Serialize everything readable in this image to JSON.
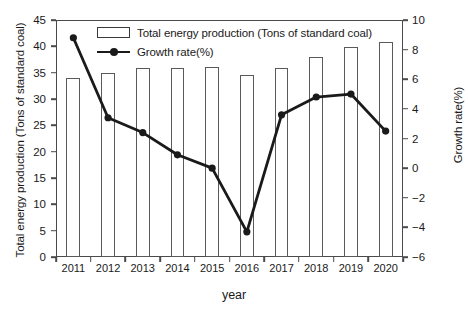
{
  "chart_data": {
    "type": "bar",
    "title": "",
    "subtitle": "",
    "xlabel": "year",
    "ylabel": "Total energy production (Tons of standard coal)",
    "y2label": "Growth rate(%)",
    "categories": [
      "2011",
      "2012",
      "2013",
      "2014",
      "2015",
      "2016",
      "2017",
      "2018",
      "2019",
      "2020"
    ],
    "ylim": [
      0,
      45
    ],
    "y2lim": [
      -6,
      10
    ],
    "yticks": [
      0,
      5,
      10,
      15,
      20,
      25,
      30,
      35,
      40,
      45
    ],
    "y2ticks": [
      -6,
      -4,
      -2,
      0,
      2,
      4,
      6,
      8,
      10
    ],
    "grid": false,
    "legend_position": "top-center",
    "series": [
      {
        "name": "Total energy production (Tons of standard coal)",
        "type": "bar",
        "axis": "left",
        "values": [
          33.9,
          35.0,
          35.8,
          35.9,
          36.1,
          34.5,
          35.9,
          38.0,
          39.9,
          40.8
        ]
      },
      {
        "name": "Growth rate(%)",
        "type": "line",
        "axis": "right",
        "values": [
          8.8,
          3.4,
          2.4,
          0.9,
          0.0,
          -4.3,
          3.6,
          4.8,
          5.0,
          2.5
        ]
      }
    ]
  },
  "legend": {
    "bar_label": "Total energy production (Tons of standard coal)",
    "line_label": "Growth rate(%)"
  },
  "axes": {
    "left_title": "Total energy production (Tons of standard coal)",
    "right_title": "Growth rate(%)",
    "bottom_title": "year"
  },
  "colors": {
    "frame": "#4a4a4a",
    "bar_outline": "#5a5a5a",
    "line": "#1a1a1a",
    "background": "#ffffff",
    "text": "#1a1a1a"
  }
}
